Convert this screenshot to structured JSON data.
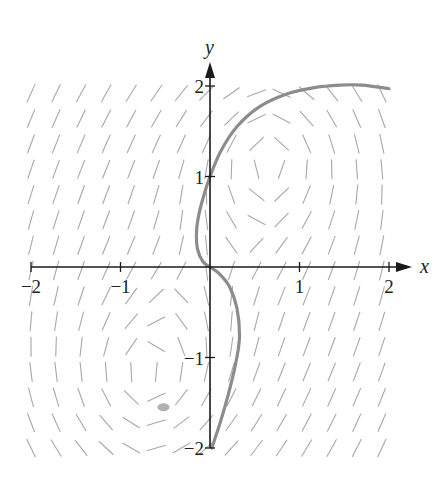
{
  "figure": {
    "type": "slope_field",
    "colors": {
      "background": "#ffffff",
      "axes": "#1a1a1a",
      "slope_segments": "#a8a8a8",
      "solution_curve": "#8c8c8c",
      "smudge": "#b0b0b0"
    }
  },
  "axes": {
    "x_label": "x",
    "y_label": "y",
    "x_range": [
      -2,
      2
    ],
    "y_range": [
      -2,
      2
    ],
    "x_ticks": [
      {
        "value": -2,
        "label": "−2"
      },
      {
        "value": -1,
        "label": "−1"
      },
      {
        "value": 1,
        "label": "1"
      },
      {
        "value": 2,
        "label": "2"
      }
    ],
    "y_ticks": [
      {
        "value": 2,
        "label": "2"
      },
      {
        "value": 1,
        "label": "1"
      },
      {
        "value": -1,
        "label": "−1"
      },
      {
        "value": -2,
        "label": "−2"
      }
    ]
  },
  "layout": {
    "origin_px": [
      210,
      267
    ],
    "unit_px_x": 89.5,
    "unit_px_y": 90.5,
    "x_axis_end_px": 412,
    "y_axis_top_px": 62,
    "grid_step": 0.28,
    "segment_length_px": 20
  },
  "slope_field": {
    "vortex_centers": [
      {
        "x": 0.7,
        "y": 1.2,
        "rx": 1.0,
        "ry": 1.0
      },
      {
        "x": -0.7,
        "y": -1.2,
        "rx": 1.0,
        "ry": 1.0
      }
    ]
  },
  "solution_curve": {
    "points": [
      [
        0.02,
        -2.0
      ],
      [
        0.12,
        -1.7
      ],
      [
        0.22,
        -1.35
      ],
      [
        0.3,
        -1.0
      ],
      [
        0.33,
        -0.75
      ],
      [
        0.3,
        -0.45
      ],
      [
        0.22,
        -0.22
      ],
      [
        0.1,
        -0.07
      ],
      [
        0.0,
        0.0
      ],
      [
        -0.08,
        0.06
      ],
      [
        -0.14,
        0.2
      ],
      [
        -0.15,
        0.4
      ],
      [
        -0.12,
        0.6
      ],
      [
        -0.06,
        0.82
      ],
      [
        0.0,
        1.0
      ],
      [
        0.12,
        1.28
      ],
      [
        0.3,
        1.55
      ],
      [
        0.55,
        1.77
      ],
      [
        0.85,
        1.91
      ],
      [
        1.15,
        1.98
      ],
      [
        1.45,
        2.01
      ],
      [
        1.7,
        2.01
      ],
      [
        2.0,
        1.97
      ]
    ]
  },
  "smudge": {
    "x": -0.52,
    "y": -1.55
  }
}
